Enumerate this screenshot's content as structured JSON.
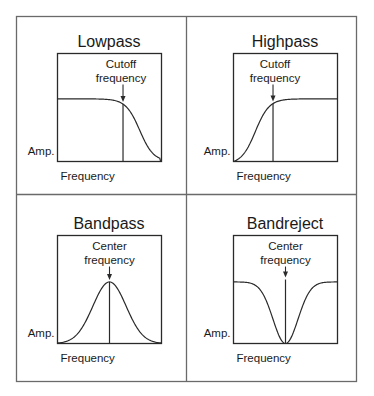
{
  "figure": {
    "colors": {
      "frame": "#6a6a6a",
      "plot_box": "#2a2a2a",
      "curve": "#2a2a2a",
      "text": "#1a1a1a",
      "background": "#ffffff"
    }
  },
  "chart_data": [
    {
      "type": "line",
      "title": "Lowpass",
      "xlabel": "Frequency",
      "ylabel": "Amp.",
      "annotation": "Cutoff\nfrequency",
      "annotation_lines": [
        "Cutoff",
        "frequency"
      ],
      "shape": "lowpass",
      "marker_x": 0.63,
      "passband_level": 0.58,
      "x_range": [
        0,
        1
      ],
      "y_range": [
        0,
        1
      ]
    },
    {
      "type": "line",
      "title": "Highpass",
      "xlabel": "Frequency",
      "ylabel": "Amp.",
      "annotation": "Cutoff\nfrequency",
      "annotation_lines": [
        "Cutoff",
        "frequency"
      ],
      "shape": "highpass",
      "marker_x": 0.38,
      "passband_level": 0.58,
      "x_range": [
        0,
        1
      ],
      "y_range": [
        0,
        1
      ]
    },
    {
      "type": "line",
      "title": "Bandpass",
      "xlabel": "Frequency",
      "ylabel": "Amp.",
      "annotation": "Center\nfrequency",
      "annotation_lines": [
        "Center",
        "frequency"
      ],
      "shape": "bandpass",
      "marker_x": 0.5,
      "passband_level": 0.57,
      "x_range": [
        0,
        1
      ],
      "y_range": [
        0,
        1
      ]
    },
    {
      "type": "line",
      "title": "Bandreject",
      "xlabel": "Frequency",
      "ylabel": "Amp.",
      "annotation": "Center\nfrequency",
      "annotation_lines": [
        "Center",
        "frequency"
      ],
      "shape": "bandreject",
      "marker_x": 0.5,
      "passband_level": 0.57,
      "x_range": [
        0,
        1
      ],
      "y_range": [
        0,
        1
      ]
    }
  ]
}
